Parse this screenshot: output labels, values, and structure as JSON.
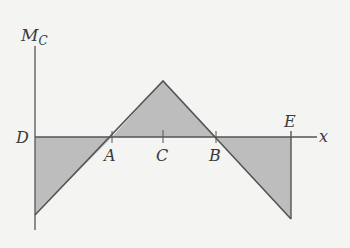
{
  "diagram": {
    "type": "bending-moment-diagram",
    "y_axis_label": "M",
    "y_axis_subscript": "C",
    "x_axis_label": "x",
    "points": [
      {
        "label": "D",
        "x": 35,
        "y": 137
      },
      {
        "label": "A",
        "x": 112,
        "y": 137
      },
      {
        "label": "C",
        "x": 163,
        "y": 137
      },
      {
        "label": "B",
        "x": 216,
        "y": 137
      },
      {
        "label": "E",
        "x": 291,
        "y": 137
      }
    ],
    "peak": {
      "x": 163,
      "y": 81
    },
    "left_min": {
      "x": 35,
      "y": 215
    },
    "right_min": {
      "x": 291,
      "y": 219
    },
    "colors": {
      "fill": "#bdbdbd",
      "line": "#555555",
      "background": "#f4f4f2"
    }
  }
}
